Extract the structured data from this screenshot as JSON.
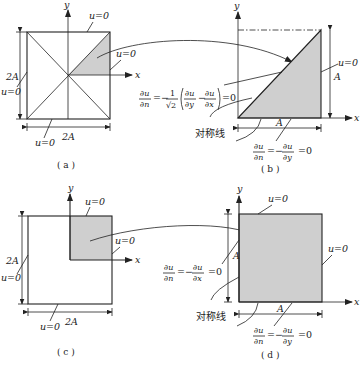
{
  "colors": {
    "line": "#222222",
    "shade": "#cfcfcf",
    "background": "#ffffff"
  },
  "panels": {
    "a": {
      "caption": "( a )",
      "axis_x": "x",
      "axis_y": "y",
      "labels": {
        "top": "u=0",
        "right": "u=0",
        "left": "u=0",
        "bottom": "u=0"
      },
      "dim_vertical": "2A",
      "dim_horizontal": "2A"
    },
    "b": {
      "caption": "( b )",
      "axis_x": "x",
      "axis_y": "y",
      "labels": {
        "right": "u=0",
        "dim_vertical": "A",
        "dim_horizontal": "A",
        "symmetry": "对称线"
      },
      "eq_diag": {
        "lhs_num": "∂u",
        "lhs_den": "∂n",
        "eq": "=",
        "coef": "−",
        "coef_num": "1",
        "coef_den": "√2",
        "t1_num": "∂u",
        "t1_den": "∂y",
        "minus": "−",
        "t2_num": "∂u",
        "t2_den": "∂x",
        "rhs": "=0"
      },
      "eq_bottom": {
        "lhs_num": "∂u",
        "lhs_den": "∂n",
        "mid": "=−",
        "r_num": "∂u",
        "r_den": "∂y",
        "rhs": "=0"
      }
    },
    "c": {
      "caption": "( c )",
      "axis_x": "x",
      "axis_y": "y",
      "labels": {
        "top": "u=0",
        "right": "u=0",
        "left": "u=0",
        "bottom": "u=0"
      },
      "dim_vertical": "2A",
      "dim_horizontal": "2A"
    },
    "d": {
      "caption": "( d )",
      "axis_x": "x",
      "axis_y": "y",
      "labels": {
        "top": "u=0",
        "right": "u=0",
        "dim_vertical": "A",
        "dim_horizontal": "A",
        "symmetry": "对称线"
      },
      "eq_left": {
        "lhs_num": "∂u",
        "lhs_den": "∂n",
        "mid": "=−",
        "r_num": "∂u",
        "r_den": "∂x",
        "rhs": "=0"
      },
      "eq_bottom": {
        "lhs_num": "∂u",
        "lhs_den": "∂n",
        "mid": "=−",
        "r_num": "∂u",
        "r_den": "∂y",
        "rhs": "=0"
      }
    }
  }
}
